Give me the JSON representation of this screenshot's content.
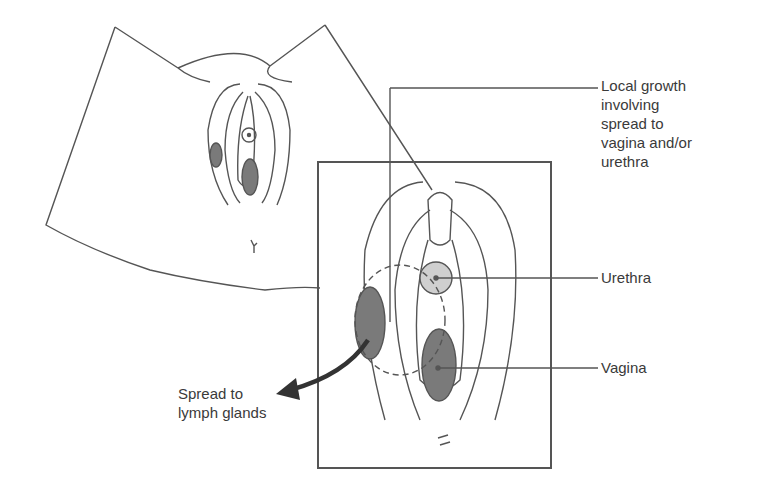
{
  "diagram": {
    "labels": {
      "local_growth": [
        "Local growth",
        "involving",
        "spread to",
        "vagina and/or",
        "urethra"
      ],
      "urethra": "Urethra",
      "vagina": "Vagina",
      "lymph": [
        "Spread to",
        "lymph glands"
      ]
    },
    "colors": {
      "line": "#555555",
      "tumor": "#7a7a7a",
      "urethra_fill": "#cfcfcf",
      "text": "#3a3a3a",
      "background": "#ffffff"
    }
  }
}
